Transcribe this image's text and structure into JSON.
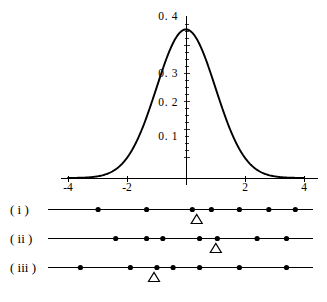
{
  "figure": {
    "background_color": "#ffffff",
    "ink_color": "#000000"
  },
  "chart_data": {
    "type": "line",
    "title": "",
    "subtitle": "",
    "xlabel": "",
    "ylabel": "",
    "xlim": [
      -4.4,
      4.4
    ],
    "ylim": [
      0,
      0.43
    ],
    "grid": false,
    "legend": null,
    "x_tick_labels": [
      "-4",
      "-2",
      "2",
      "4"
    ],
    "x_tick_values": [
      -4,
      -2,
      2,
      4
    ],
    "y_tick_labels": [
      "0. 1",
      "0. 2",
      "0. 3",
      "0. 4"
    ],
    "y_tick_values": [
      0.1,
      0.2,
      0.3,
      0.4
    ],
    "series": [
      {
        "name": "normal density",
        "function": "phi(x) = exp(-x^2/2)/sqrt(2*pi)",
        "x": [
          -4,
          -3.5,
          -3,
          -2.5,
          -2,
          -1.5,
          -1,
          -0.5,
          0,
          0.5,
          1,
          1.5,
          2,
          2.5,
          3,
          3.5,
          4
        ],
        "y": [
          0.0001,
          0.0009,
          0.0044,
          0.0175,
          0.054,
          0.1295,
          0.242,
          0.3521,
          0.3989,
          0.3521,
          0.242,
          0.1295,
          0.054,
          0.0175,
          0.0044,
          0.0009,
          0.0001
        ],
        "peak_x": 0,
        "peak_y": 0.4
      }
    ]
  },
  "number_lines": {
    "axis_min": -4.7,
    "axis_max": 4.3,
    "rows": [
      {
        "label": "( i )",
        "dot_values": [
          -3.0,
          -1.35,
          0.2,
          0.85,
          1.8,
          2.8,
          3.7
        ],
        "marker": {
          "glyph": "triangle",
          "value": 0.35
        }
      },
      {
        "label": "( ii )",
        "dot_values": [
          -2.4,
          -1.35,
          -0.8,
          0.45,
          1.05,
          2.4,
          3.4
        ],
        "marker": {
          "glyph": "triangle",
          "value": 1.0
        }
      },
      {
        "label": "( iii )",
        "dot_values": [
          -3.6,
          -1.9,
          -1.0,
          -0.45,
          0.45,
          1.8,
          3.4
        ],
        "marker": {
          "glyph": "triangle",
          "value": -1.1
        }
      }
    ]
  }
}
